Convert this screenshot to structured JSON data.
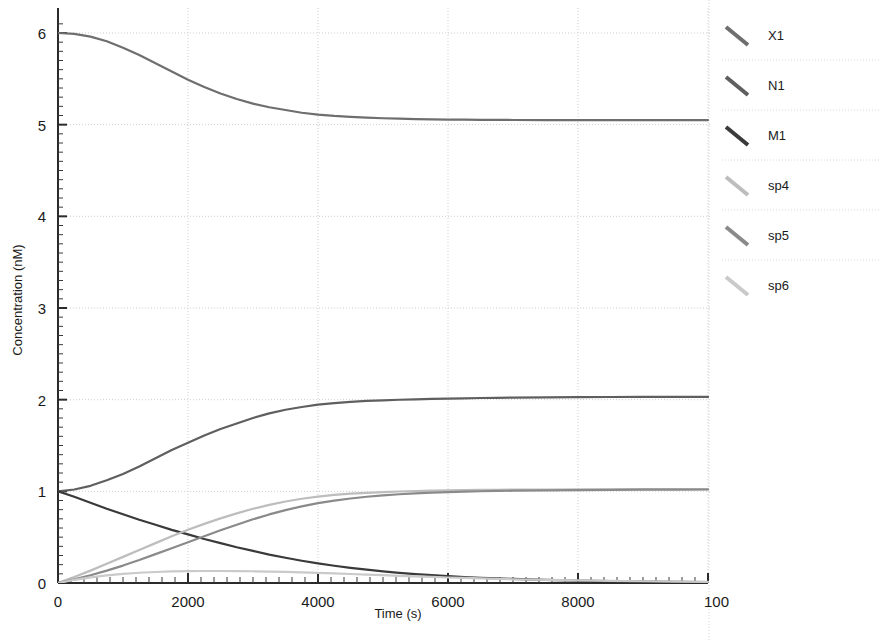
{
  "chart_data": {
    "type": "line",
    "title": "",
    "xlabel": "Time (s)",
    "ylabel": "Concentration (nM)",
    "xlim": [
      0,
      10000
    ],
    "ylim": [
      0,
      6.12
    ],
    "xticks": [
      0,
      2000,
      4000,
      6000,
      8000,
      10000
    ],
    "xtick_labels": [
      "0",
      "2000",
      "4000",
      "6000",
      "8000",
      "100"
    ],
    "yticks": [
      0,
      1,
      2,
      3,
      4,
      5,
      6
    ],
    "ytick_labels": [
      "0",
      "1",
      "2",
      "3",
      "4",
      "5",
      "6"
    ],
    "grid": true,
    "grid_style": "dotted",
    "grid_color": "#cfcfcf",
    "minor_ticks": true,
    "legend_position": "right-outside",
    "x": [
      0,
      250,
      500,
      750,
      1000,
      1250,
      1500,
      1750,
      2000,
      2250,
      2500,
      2750,
      3000,
      3250,
      3500,
      3750,
      4000,
      4250,
      4500,
      4750,
      5000,
      5250,
      5500,
      5750,
      6000,
      6250,
      6500,
      6750,
      7000,
      7500,
      8000,
      8500,
      9000,
      9500,
      10000
    ],
    "series": [
      {
        "name": "X1",
        "color": "#6e6e6e",
        "values": [
          6.0,
          5.99,
          5.96,
          5.91,
          5.84,
          5.76,
          5.67,
          5.58,
          5.49,
          5.41,
          5.34,
          5.28,
          5.23,
          5.19,
          5.16,
          5.13,
          5.11,
          5.095,
          5.085,
          5.077,
          5.07,
          5.065,
          5.061,
          5.058,
          5.056,
          5.054,
          5.053,
          5.052,
          5.051,
          5.05,
          5.05,
          5.05,
          5.05,
          5.05,
          5.05
        ]
      },
      {
        "name": "N1",
        "color": "#5f5f5f",
        "values": [
          1.0,
          1.02,
          1.06,
          1.12,
          1.19,
          1.27,
          1.36,
          1.45,
          1.53,
          1.61,
          1.68,
          1.74,
          1.8,
          1.85,
          1.89,
          1.92,
          1.945,
          1.963,
          1.976,
          1.986,
          1.993,
          1.999,
          2.004,
          2.008,
          2.012,
          2.015,
          2.018,
          2.02,
          2.022,
          2.025,
          2.028,
          2.029,
          2.03,
          2.03,
          2.03
        ]
      },
      {
        "name": "M1",
        "color": "#3a3a3a",
        "values": [
          1.0,
          0.94,
          0.875,
          0.81,
          0.75,
          0.69,
          0.635,
          0.58,
          0.53,
          0.48,
          0.435,
          0.39,
          0.35,
          0.31,
          0.275,
          0.243,
          0.214,
          0.188,
          0.165,
          0.145,
          0.127,
          0.111,
          0.097,
          0.085,
          0.074,
          0.065,
          0.057,
          0.05,
          0.044,
          0.034,
          0.026,
          0.021,
          0.016,
          0.013,
          0.01
        ]
      },
      {
        "name": "sp4",
        "color": "#bdbdbd",
        "values": [
          0.0,
          0.065,
          0.135,
          0.21,
          0.285,
          0.36,
          0.435,
          0.51,
          0.58,
          0.645,
          0.705,
          0.76,
          0.81,
          0.853,
          0.889,
          0.919,
          0.943,
          0.961,
          0.974,
          0.984,
          0.992,
          0.998,
          1.003,
          1.007,
          1.01,
          1.013,
          1.015,
          1.017,
          1.018,
          1.02,
          1.022,
          1.023,
          1.024,
          1.025,
          1.025
        ]
      },
      {
        "name": "sp5",
        "color": "#8a8a8a",
        "values": [
          0.0,
          0.04,
          0.085,
          0.135,
          0.19,
          0.25,
          0.315,
          0.38,
          0.445,
          0.51,
          0.575,
          0.635,
          0.695,
          0.748,
          0.795,
          0.836,
          0.871,
          0.899,
          0.922,
          0.941,
          0.956,
          0.968,
          0.978,
          0.986,
          0.992,
          0.997,
          1.001,
          1.004,
          1.007,
          1.011,
          1.014,
          1.016,
          1.018,
          1.019,
          1.02
        ]
      },
      {
        "name": "sp6",
        "color": "#cacaca",
        "values": [
          0.0,
          0.035,
          0.062,
          0.084,
          0.1,
          0.112,
          0.12,
          0.126,
          0.129,
          0.131,
          0.131,
          0.13,
          0.128,
          0.125,
          0.121,
          0.116,
          0.11,
          0.104,
          0.098,
          0.091,
          0.085,
          0.078,
          0.072,
          0.066,
          0.06,
          0.055,
          0.05,
          0.045,
          0.041,
          0.034,
          0.028,
          0.023,
          0.019,
          0.016,
          0.013
        ]
      }
    ]
  },
  "legend": {
    "items": [
      {
        "label": "X1"
      },
      {
        "label": "N1"
      },
      {
        "label": "M1"
      },
      {
        "label": "sp4"
      },
      {
        "label": "sp5"
      },
      {
        "label": "sp6"
      }
    ]
  },
  "axes": {
    "x_title": "Time (s)",
    "y_title": "Concentration (nM)"
  }
}
